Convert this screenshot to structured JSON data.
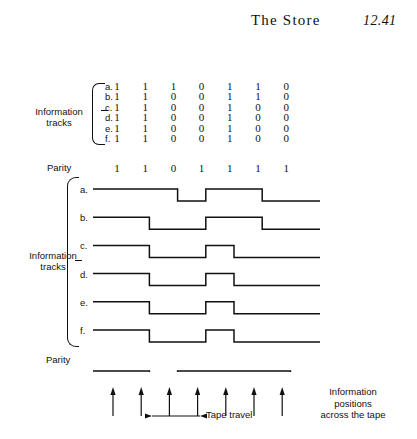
{
  "header": {
    "title": "The Store",
    "page_number": "12.41"
  },
  "matrix": {
    "group_label_line1": "Information",
    "group_label_line2": "tracks",
    "row_labels": [
      "a.",
      "b.",
      "c.",
      "d.",
      "e.",
      "f."
    ],
    "rows": [
      [
        "1",
        "1",
        "1",
        "0",
        "1",
        "1",
        "0"
      ],
      [
        "1",
        "1",
        "0",
        "0",
        "1",
        "1",
        "0"
      ],
      [
        "1",
        "1",
        "0",
        "0",
        "1",
        "0",
        "0"
      ],
      [
        "1",
        "1",
        "0",
        "0",
        "1",
        "0",
        "0"
      ],
      [
        "1",
        "1",
        "0",
        "0",
        "1",
        "0",
        "0"
      ],
      [
        "1",
        "1",
        "0",
        "0",
        "1",
        "0",
        "0"
      ]
    ],
    "parity_label": "Parity",
    "parity_bits": [
      "1",
      "1",
      "0",
      "1",
      "1",
      "1",
      "1"
    ]
  },
  "waveforms": {
    "group_label_line1": "Information",
    "group_label_line2": "tracks",
    "row_labels": [
      "a.",
      "b.",
      "c.",
      "d.",
      "e.",
      "f."
    ],
    "parity_label": "Parity",
    "traces": [
      {
        "name": "a",
        "bits": [
          1,
          1,
          1,
          0,
          1,
          1,
          0
        ]
      },
      {
        "name": "b",
        "bits": [
          1,
          1,
          0,
          0,
          1,
          1,
          0
        ]
      },
      {
        "name": "c",
        "bits": [
          1,
          1,
          0,
          0,
          1,
          0,
          0
        ]
      },
      {
        "name": "d",
        "bits": [
          1,
          1,
          0,
          0,
          1,
          0,
          0
        ]
      },
      {
        "name": "e",
        "bits": [
          1,
          1,
          0,
          0,
          1,
          0,
          0
        ]
      },
      {
        "name": "f",
        "bits": [
          1,
          1,
          0,
          0,
          1,
          0,
          0
        ]
      }
    ],
    "parity_trace": {
      "name": "parity",
      "bits": [
        1,
        1,
        0,
        1,
        1,
        1,
        1
      ]
    }
  },
  "annotations": {
    "tape_travel": "Tape travel",
    "info_positions_line1": "Information",
    "info_positions_line2": "positions",
    "info_positions_line3": "across the tape",
    "arrow_count": 7
  },
  "geometry": {
    "col_start_x": 112,
    "col_spacing": 28.2,
    "wave_left_x": 93,
    "wave_right_x": 320,
    "wave_row_spacing": 28.2,
    "wave_amplitude": 12,
    "arrow_start_x": 113,
    "arrow_spacing": 28.2
  },
  "style": {
    "ink": "#111111",
    "paper": "#ffffff"
  }
}
